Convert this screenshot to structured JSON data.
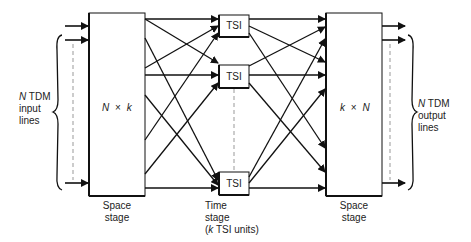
{
  "diagram": {
    "type": "time-space-time switch (space-time-space)",
    "left_brace_label": {
      "line1_var": "N",
      "line1_rest": " TDM",
      "line2": "input",
      "line3": "lines"
    },
    "right_brace_label": {
      "line1_var": "N",
      "line1_rest": " TDM",
      "line2": "output",
      "line3": "lines"
    },
    "left_stage": {
      "matrix_a": "N",
      "times": "×",
      "matrix_b": "k",
      "caption_line1": "Space",
      "caption_line2": "stage"
    },
    "middle_stage": {
      "units": [
        "TSI",
        "TSI",
        "TSI"
      ],
      "caption_line1": "Time",
      "caption_line2": "stage",
      "caption_line3_var": "k",
      "caption_line3_rest": " TSI units)",
      "caption_line3_open": "("
    },
    "right_stage": {
      "matrix_a": "k",
      "times": "×",
      "matrix_b": "N",
      "caption_line1": "Space",
      "caption_line2": "stage"
    },
    "colors": {
      "line": "#111111",
      "dashed": "#999999",
      "background": "#ffffff"
    }
  }
}
